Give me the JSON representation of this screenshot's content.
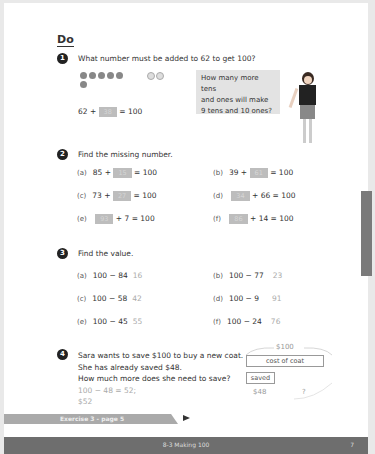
{
  "section_title": "Do",
  "q1": {
    "number": "1",
    "text": "What number must be added to 62 to get 100?",
    "tens_counters": 6,
    "ones_counters": 2,
    "equation": {
      "left": "62 +",
      "answer": "38",
      "right": "= 100"
    },
    "speech_bubble": [
      "How many more tens",
      "and ones will make",
      "9 tens and 10 ones?"
    ]
  },
  "q2": {
    "number": "2",
    "text": "Find the missing number.",
    "items": [
      {
        "label": "(a)",
        "before": "85 +",
        "answer": "15",
        "after": "= 100"
      },
      {
        "label": "(b)",
        "before": "39 +",
        "answer": "61",
        "after": "= 100"
      },
      {
        "label": "(c)",
        "before": "73 +",
        "answer": "27",
        "after": "= 100"
      },
      {
        "label": "(d)",
        "before": "",
        "answer": "34",
        "after": "+ 66 = 100"
      },
      {
        "label": "(e)",
        "before": "",
        "answer": "93",
        "after": "+ 7 = 100"
      },
      {
        "label": "(f)",
        "before": "",
        "answer": "86",
        "after": "+ 14 = 100"
      }
    ]
  },
  "q3": {
    "number": "3",
    "text": "Find the value.",
    "items": [
      {
        "label": "(a)",
        "expr": "100 − 84",
        "answer": "16"
      },
      {
        "label": "(b)",
        "expr": "100 − 77",
        "answer": "23"
      },
      {
        "label": "(c)",
        "expr": "100 − 58",
        "answer": "42"
      },
      {
        "label": "(d)",
        "expr": "100 − 9",
        "answer": "91"
      },
      {
        "label": "(e)",
        "expr": "100 − 45",
        "answer": "55"
      },
      {
        "label": "(f)",
        "expr": "100 − 24",
        "answer": "76"
      }
    ]
  },
  "q4": {
    "number": "4",
    "lines": [
      "Sara wants to save $100 to buy a new coat.",
      "She has already saved $48.",
      "How much more does she need to save?"
    ],
    "answer_lines": [
      "100 − 48 = 52;",
      "$52"
    ],
    "bar_model": {
      "total": "$100",
      "whole_label": "cost of coat",
      "part_label": "saved",
      "part_value": "$48",
      "unknown": "?"
    }
  },
  "exercise_link": "Exercise 3 - page 5",
  "footer": {
    "chapter": "8-3  Making 100",
    "page": "7"
  }
}
